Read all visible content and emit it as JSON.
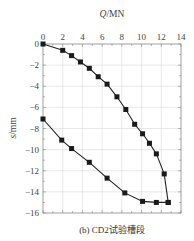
{
  "chart_data": {
    "type": "line",
    "title": "",
    "caption": "(b) CD2试验槽段",
    "xlabel": "Q/MN",
    "ylabel": "s/mm",
    "xlim": [
      0,
      14
    ],
    "ylim": [
      -16,
      0
    ],
    "x_ticks": [
      0,
      2,
      4,
      6,
      8,
      10,
      12,
      14
    ],
    "y_ticks": [
      0,
      -2,
      -4,
      -6,
      -8,
      -10,
      -12,
      -14,
      -16
    ],
    "x_tick_labels": [
      "0",
      "2",
      "4",
      "6",
      "8",
      "10",
      "12",
      "14"
    ],
    "y_tick_labels": [
      "0",
      "−2",
      "−4",
      "−6",
      "−8",
      "−10",
      "−12",
      "−14",
      "−16"
    ],
    "x_axis_position": "top",
    "grid": true,
    "marker": "square",
    "series": [
      {
        "name": "loading",
        "x": [
          0,
          2.0,
          2.9,
          3.8,
          4.7,
          5.6,
          6.5,
          7.5,
          8.4,
          9.3,
          10.1,
          10.8,
          11.5,
          12.3,
          12.7
        ],
        "y": [
          0,
          -0.6,
          -1.1,
          -1.7,
          -2.3,
          -3.1,
          -3.8,
          -5.0,
          -6.2,
          -7.6,
          -8.5,
          -9.4,
          -10.4,
          -12.3,
          -15.0
        ]
      },
      {
        "name": "unloading",
        "x": [
          12.7,
          11.5,
          10.1,
          8.3,
          6.5,
          4.7,
          2.9,
          1.9,
          0
        ],
        "y": [
          -15.0,
          -15.0,
          -14.9,
          -14.1,
          -12.7,
          -11.2,
          -9.9,
          -9.1,
          -7.1
        ]
      }
    ]
  }
}
